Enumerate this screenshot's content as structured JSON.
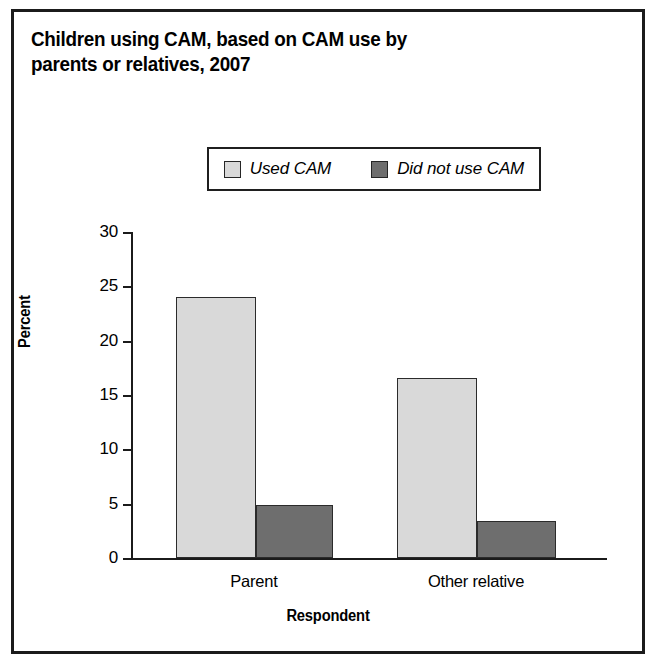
{
  "figure": {
    "title": "Children using CAM, based on CAM use by parents or relatives, 2007",
    "border_color": "#1b1b1b",
    "background": "#ffffff"
  },
  "legend": {
    "position": "upper-center",
    "entries": [
      {
        "label": "Used CAM",
        "color": "#d9d9d9"
      },
      {
        "label": "Did not use CAM",
        "color": "#6e6e6e"
      }
    ]
  },
  "axes": {
    "ylabel": "Percent",
    "xlabel": "Respondent",
    "yticks": [
      "30",
      "25",
      "20",
      "15",
      "10",
      "5",
      "0"
    ],
    "xticklabels": [
      "Parent",
      "Other relative"
    ]
  },
  "chart_data": {
    "type": "bar",
    "title": "Children using CAM, based on CAM use by parents or relatives, 2007",
    "xlabel": "Respondent",
    "ylabel": "Percent",
    "categories": [
      "Parent",
      "Other relative"
    ],
    "series": [
      {
        "name": "Used CAM",
        "color": "#d9d9d9",
        "values": [
          24.0,
          16.6
        ]
      },
      {
        "name": "Did not use CAM",
        "color": "#6e6e6e",
        "values": [
          4.9,
          3.4
        ]
      }
    ],
    "ylim": [
      0,
      30
    ],
    "ytick_values": [
      0,
      5,
      10,
      15,
      20,
      25,
      30
    ],
    "grid": false,
    "legend_position": "upper center"
  }
}
